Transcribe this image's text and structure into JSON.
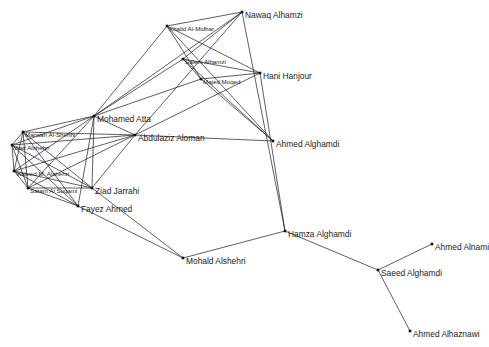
{
  "diagram": {
    "type": "network-graph",
    "nodes": [
      {
        "id": "nawaq",
        "label": "Nawaq Alhamzi",
        "x": 242,
        "y": 12,
        "size": "lg"
      },
      {
        "id": "khalid",
        "label": "Khalid Al-Midhar",
        "x": 167,
        "y": 26,
        "size": "sm"
      },
      {
        "id": "salem",
        "label": "Salem Alhamzi",
        "x": 183,
        "y": 59,
        "size": "sm"
      },
      {
        "id": "majed",
        "label": "Majed Moqed",
        "x": 201,
        "y": 79,
        "size": "sm"
      },
      {
        "id": "hani",
        "label": "Hani Hanjour",
        "x": 260,
        "y": 73,
        "size": "lg"
      },
      {
        "id": "atta",
        "label": "Mohamed Atta",
        "x": 94,
        "y": 116,
        "size": "lg"
      },
      {
        "id": "abdulaziz",
        "label": "Abdulaziz Aloman",
        "x": 135,
        "y": 135,
        "size": "lg"
      },
      {
        "id": "ahmed_alghamdi",
        "label": "Ahmed Alghamdi",
        "x": 273,
        "y": 141,
        "size": "lg"
      },
      {
        "id": "marwan",
        "label": "Marwan Al-Shehhi",
        "x": 23,
        "y": 132,
        "size": "sm"
      },
      {
        "id": "wail",
        "label": "Wail Alshehri",
        "x": 12,
        "y": 145,
        "size": "sm"
      },
      {
        "id": "waleed",
        "label": "Waleed M. Alshehri",
        "x": 14,
        "y": 171,
        "size": "sm"
      },
      {
        "id": "satam",
        "label": "Satam Al Suqami",
        "x": 28,
        "y": 188,
        "size": "sm"
      },
      {
        "id": "ziad",
        "label": "Ziad Jarrahi",
        "x": 92,
        "y": 188,
        "size": "lg"
      },
      {
        "id": "fayez",
        "label": "Fayez Ahmed",
        "x": 78,
        "y": 206,
        "size": "lg"
      },
      {
        "id": "mohald",
        "label": "Mohald Alshehri",
        "x": 183,
        "y": 258,
        "size": "lg"
      },
      {
        "id": "hamza",
        "label": "Hamza Alghamdi",
        "x": 285,
        "y": 231,
        "size": "lg"
      },
      {
        "id": "saeed",
        "label": "Saeed Alghamdi",
        "x": 378,
        "y": 270,
        "size": "lg"
      },
      {
        "id": "alnami",
        "label": "Ahmed Alnami",
        "x": 432,
        "y": 244,
        "size": "lg"
      },
      {
        "id": "alhaznawi",
        "label": "Ahmed Alhaznawi",
        "x": 410,
        "y": 331,
        "size": "lg"
      }
    ],
    "edges": [
      [
        "nawaq",
        "khalid"
      ],
      [
        "nawaq",
        "atta"
      ],
      [
        "nawaq",
        "abdulaziz"
      ],
      [
        "nawaq",
        "salem"
      ],
      [
        "nawaq",
        "hamza"
      ],
      [
        "khalid",
        "atta"
      ],
      [
        "khalid",
        "hani"
      ],
      [
        "khalid",
        "majed"
      ],
      [
        "khalid",
        "ahmed_alghamdi"
      ],
      [
        "salem",
        "hani"
      ],
      [
        "salem",
        "atta"
      ],
      [
        "salem",
        "majed"
      ],
      [
        "salem",
        "ahmed_alghamdi"
      ],
      [
        "majed",
        "hani"
      ],
      [
        "majed",
        "atta"
      ],
      [
        "majed",
        "ahmed_alghamdi"
      ],
      [
        "hani",
        "abdulaziz"
      ],
      [
        "hani",
        "hamza"
      ],
      [
        "atta",
        "abdulaziz"
      ],
      [
        "atta",
        "marwan"
      ],
      [
        "atta",
        "wail"
      ],
      [
        "atta",
        "waleed"
      ],
      [
        "atta",
        "ziad"
      ],
      [
        "atta",
        "fayez"
      ],
      [
        "atta",
        "satam"
      ],
      [
        "abdulaziz",
        "ahmed_alghamdi"
      ],
      [
        "abdulaziz",
        "marwan"
      ],
      [
        "abdulaziz",
        "wail"
      ],
      [
        "abdulaziz",
        "waleed"
      ],
      [
        "abdulaziz",
        "ziad"
      ],
      [
        "abdulaziz",
        "satam"
      ],
      [
        "marwan",
        "wail"
      ],
      [
        "marwan",
        "waleed"
      ],
      [
        "marwan",
        "satam"
      ],
      [
        "marwan",
        "ziad"
      ],
      [
        "marwan",
        "fayez"
      ],
      [
        "wail",
        "waleed"
      ],
      [
        "wail",
        "satam"
      ],
      [
        "wail",
        "ziad"
      ],
      [
        "wail",
        "fayez"
      ],
      [
        "waleed",
        "satam"
      ],
      [
        "waleed",
        "ziad"
      ],
      [
        "waleed",
        "fayez"
      ],
      [
        "satam",
        "ziad"
      ],
      [
        "satam",
        "fayez"
      ],
      [
        "ziad",
        "mohald"
      ],
      [
        "fayez",
        "mohald"
      ],
      [
        "mohald",
        "hamza"
      ],
      [
        "hamza",
        "saeed"
      ],
      [
        "saeed",
        "alnami"
      ],
      [
        "saeed",
        "alhaznawi"
      ]
    ]
  },
  "colors": {
    "background": "#ffffff",
    "edge": "#1a1a1a",
    "node": "#111111",
    "label": "#222222"
  }
}
